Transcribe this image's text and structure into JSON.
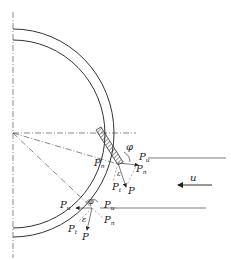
{
  "figure": {
    "flow_label": "u",
    "upper_point": {
      "labels": {
        "normal_left": "P",
        "normal_left_sub": "n",
        "angle_phi": "φ",
        "right_top": "P",
        "right_top_sub": "u",
        "right_mid": "P",
        "right_mid_sub": "n",
        "angle_eps": "ε",
        "tangential": "P",
        "tangential_sub": "t",
        "resultant": "P"
      }
    },
    "lower_point": {
      "labels": {
        "left": "P",
        "left_sub": "u",
        "angle_phi": "φ",
        "right": "P",
        "right_sub": "u",
        "normal": "P",
        "normal_sub": "n",
        "angle_eps": "ε",
        "tangential": "P",
        "tangential_sub": "t",
        "resultant": "P"
      }
    }
  }
}
